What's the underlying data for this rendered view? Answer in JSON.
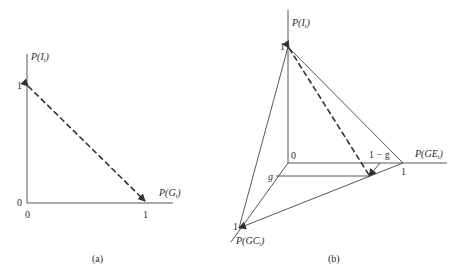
{
  "figure": {
    "panels": [
      {
        "id": "a",
        "caption": "(a)",
        "y_axis": {
          "label": "P(I",
          "subscript": "t",
          "close": ")",
          "tick_top": "1",
          "origin": "0"
        },
        "x_axis": {
          "label": "P(G",
          "subscript": "t",
          "close": ")",
          "tick_right": "1",
          "origin": "0"
        },
        "dashed_line": {
          "from": "(0,1)",
          "to": "(1,0)"
        }
      },
      {
        "id": "b",
        "caption": "(b)",
        "vertical_axis": {
          "label": "P(I",
          "subscript": "t",
          "close": ")",
          "tick": "1"
        },
        "horizontal_axis": {
          "label": "P(GE",
          "subscript": "t",
          "close": ")",
          "tick": "1",
          "inner_tick": "1 − g"
        },
        "diagonal_axis": {
          "label": "P(GC",
          "subscript": "t",
          "close": ")",
          "tick": "1",
          "inner_tick": "g"
        },
        "origin": "0"
      }
    ]
  }
}
